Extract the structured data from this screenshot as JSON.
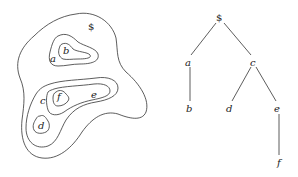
{
  "figure": {
    "regions": {
      "root": "$",
      "labels": [
        {
          "id": "dollar",
          "text": "$",
          "x": 88,
          "y": 30
        },
        {
          "id": "a",
          "text": "a",
          "x": 50,
          "y": 62
        },
        {
          "id": "b",
          "text": "b",
          "x": 63,
          "y": 54
        },
        {
          "id": "c",
          "text": "c",
          "x": 40,
          "y": 104
        },
        {
          "id": "d",
          "text": "d",
          "x": 38,
          "y": 129
        },
        {
          "id": "e",
          "text": "e",
          "x": 91,
          "y": 98
        },
        {
          "id": "f",
          "text": "f",
          "x": 57,
          "y": 100
        }
      ]
    },
    "tree": {
      "nodes": [
        {
          "id": "dollar",
          "text": "$",
          "x": 220,
          "y": 21
        },
        {
          "id": "a",
          "text": "a",
          "x": 188,
          "y": 64
        },
        {
          "id": "c",
          "text": "c",
          "x": 253,
          "y": 64
        },
        {
          "id": "b",
          "text": "b",
          "x": 189,
          "y": 111
        },
        {
          "id": "d",
          "text": "d",
          "x": 229,
          "y": 111
        },
        {
          "id": "e",
          "text": "e",
          "x": 277,
          "y": 111
        },
        {
          "id": "f",
          "text": "f",
          "x": 280,
          "y": 165
        }
      ],
      "edges": [
        [
          "dollar",
          "a"
        ],
        [
          "dollar",
          "c"
        ],
        [
          "a",
          "b"
        ],
        [
          "c",
          "d"
        ],
        [
          "c",
          "e"
        ],
        [
          "e",
          "f"
        ]
      ]
    },
    "labels": {
      "region_dollar": "$",
      "region_a": "a",
      "region_b": "b",
      "region_c": "c",
      "region_d": "d",
      "region_e": "e",
      "region_f": "f",
      "tree_dollar": "$",
      "tree_a": "a",
      "tree_b": "b",
      "tree_c": "c",
      "tree_d": "d",
      "tree_e": "e",
      "tree_f": "f"
    }
  }
}
